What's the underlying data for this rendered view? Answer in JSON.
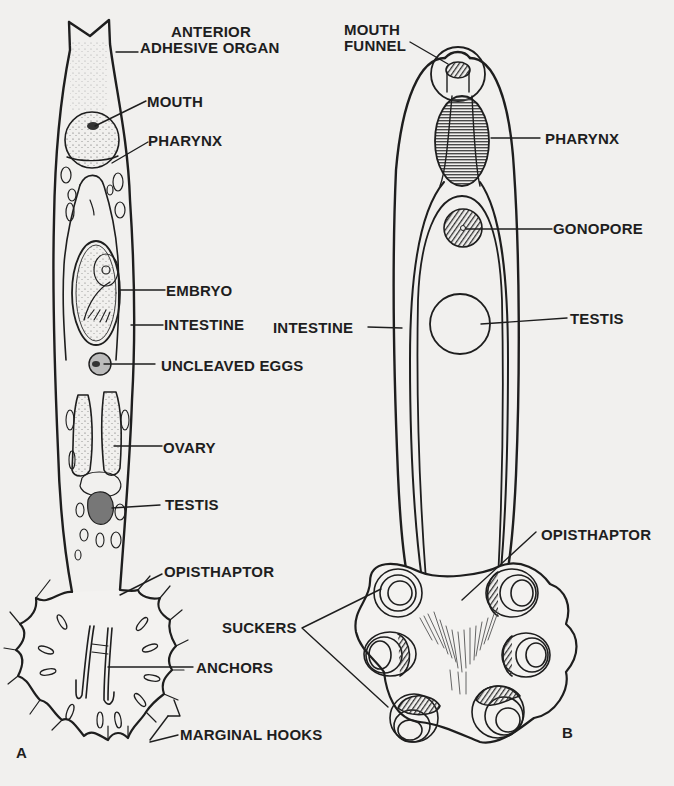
{
  "figure": {
    "panels": [
      {
        "id": "A",
        "letter": "A",
        "labels": {
          "anterior_adhesive_organ_l1": "ANTERIOR",
          "anterior_adhesive_organ_l2": "ADHESIVE ORGAN",
          "mouth": "MOUTH",
          "pharynx": "PHARYNX",
          "embryo": "EMBRYO",
          "intestine": "INTESTINE",
          "uncleaved_eggs": "UNCLEAVED EGGS",
          "ovary": "OVARY",
          "testis": "TESTIS",
          "opisthaptor": "OPISTHAPTOR",
          "anchors": "ANCHORS",
          "marginal_hooks": "MARGINAL HOOKS"
        }
      },
      {
        "id": "B",
        "letter": "B",
        "labels": {
          "mouth_funnel_l1": "MOUTH",
          "mouth_funnel_l2": "FUNNEL",
          "pharynx": "PHARYNX",
          "gonopore": "GONOPORE",
          "intestine": "INTESTINE",
          "testis": "TESTIS",
          "opisthaptor": "OPISTHAPTOR",
          "suckers": "SUCKERS"
        }
      }
    ],
    "colors": {
      "background": "#f1f0ee",
      "ink": "#1e1e1e",
      "shading": "#6e6e6e"
    }
  }
}
